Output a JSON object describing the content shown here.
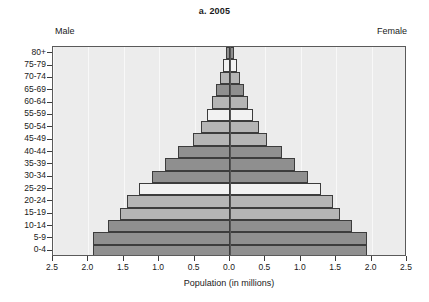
{
  "chart_data": {
    "type": "bar",
    "subtype": "population-pyramid",
    "title": "a. 2005",
    "xlabel": "Population (in millions)",
    "ylabel": "",
    "xlim": [
      -2.5,
      2.5
    ],
    "xticks": [
      -2.5,
      -2.0,
      -1.5,
      -1.0,
      -0.5,
      0.0,
      0.5,
      1.0,
      1.5,
      2.0,
      2.5
    ],
    "xtick_labels": [
      "2.5",
      "2.0",
      "1.5",
      "1.0",
      "0.5",
      "0.0",
      "0.5",
      "1.0",
      "1.5",
      "2.0",
      "2.5"
    ],
    "grid": true,
    "legend": "none",
    "left_side_label": "Male",
    "right_side_label": "Female",
    "categories": [
      "80+",
      "75-79",
      "70-74",
      "65-69",
      "60-64",
      "55-59",
      "50-54",
      "45-49",
      "40-44",
      "35-39",
      "30-34",
      "25-29",
      "20-24",
      "15-19",
      "10-14",
      "5-9",
      "0-4"
    ],
    "series": [
      {
        "name": "Male",
        "values": [
          0.06,
          0.1,
          0.14,
          0.2,
          0.26,
          0.33,
          0.41,
          0.52,
          0.74,
          0.92,
          1.1,
          1.28,
          1.45,
          1.56,
          1.72,
          1.93,
          1.93
        ]
      },
      {
        "name": "Female",
        "values": [
          0.06,
          0.1,
          0.14,
          0.2,
          0.26,
          0.33,
          0.41,
          0.52,
          0.74,
          0.92,
          1.1,
          1.28,
          1.45,
          1.56,
          1.72,
          1.93,
          1.93
        ]
      }
    ],
    "bar_colors": [
      "#8f8f8f",
      "#f2f2f2",
      "#b5b5b5",
      "#8f8f8f",
      "#b5b5b5",
      "#f2f2f2",
      "#b5b5b5",
      "#b5b5b5",
      "#8f8f8f",
      "#8f8f8f",
      "#8f8f8f",
      "#f2f2f2",
      "#b5b5b5",
      "#b5b5b5",
      "#8f8f8f",
      "#8f8f8f",
      "#8f8f8f"
    ],
    "panel_background": "#ececec",
    "gridline_color": "#f8f8f8",
    "axis_color": "#3c3c3c",
    "center_line_color": "#555555"
  }
}
